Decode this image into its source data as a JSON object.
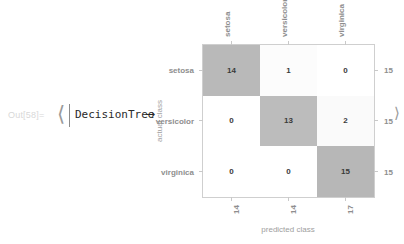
{
  "notebook": {
    "out_prompt": "Out[58]=",
    "expression": {
      "open_bracket": "⟨",
      "key": "DecisionTree",
      "arrow": "→",
      "close_bracket": "⟩"
    }
  },
  "chart_data": {
    "type": "heatmap",
    "title": "",
    "xlabel": "predicted class",
    "ylabel": "actual class",
    "categories": [
      "setosa",
      "versicolor",
      "virginica"
    ],
    "row_labels": [
      "setosa",
      "versicolor",
      "virginica"
    ],
    "col_labels": [
      "setosa",
      "versicolor",
      "virginica"
    ],
    "matrix": [
      [
        14,
        1,
        0
      ],
      [
        0,
        13,
        2
      ],
      [
        0,
        0,
        15
      ]
    ],
    "row_totals": [
      15,
      15,
      15
    ],
    "col_totals": [
      14,
      14,
      17
    ],
    "cell_colors": [
      [
        "#b9b9b9",
        "#fcfcfc",
        "#ffffff"
      ],
      [
        "#ffffff",
        "#bcbcbc",
        "#fafafa"
      ],
      [
        "#ffffff",
        "#ffffff",
        "#b7b7b7"
      ]
    ],
    "grid": true,
    "legend": "none",
    "accent": "#b9b9b9"
  }
}
